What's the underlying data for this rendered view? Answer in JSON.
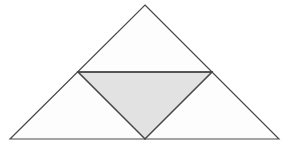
{
  "figure": {
    "background_color": "#ffffff",
    "canvas": {
      "width": 288,
      "height": 147
    },
    "stroke_color": "#4a4a4a",
    "stroke_width": 1.2,
    "outer_triangle": {
      "name": "outer-triangle",
      "fill_color": "#fdfdfd",
      "shaded": false,
      "vertices": [
        {
          "label": "apex",
          "x": 145,
          "y": 5
        },
        {
          "label": "bottom-right",
          "x": 279,
          "y": 139
        },
        {
          "label": "bottom-left",
          "x": 10,
          "y": 139
        }
      ],
      "points": "145,5 279,139 10,139"
    },
    "inner_triangle": {
      "name": "inner-inverted-triangle",
      "fill_color": "#e2e2e2",
      "shaded": true,
      "orientation": "inverted",
      "vertices": [
        {
          "label": "left-midpoint",
          "x": 78,
          "y": 72
        },
        {
          "label": "right-midpoint",
          "x": 212,
          "y": 72
        },
        {
          "label": "base-midpoint",
          "x": 145,
          "y": 139
        }
      ],
      "points": "78,72 212,72 145,139"
    },
    "midsegments": [
      {
        "name": "horizontal-midsegment",
        "from": {
          "x": 78,
          "y": 72
        },
        "to": {
          "x": 212,
          "y": 72
        }
      },
      {
        "name": "left-midsegment",
        "from": {
          "x": 78,
          "y": 72
        },
        "to": {
          "x": 145,
          "y": 139
        }
      },
      {
        "name": "right-midsegment",
        "from": {
          "x": 212,
          "y": 72
        },
        "to": {
          "x": 145,
          "y": 139
        }
      }
    ]
  }
}
